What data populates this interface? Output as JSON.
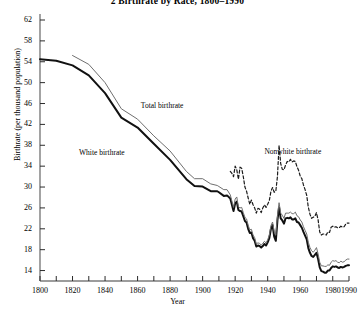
{
  "chart_data": {
    "type": "line",
    "title": "2  Birthrate by Race, 1800–1990",
    "xlabel": "Year",
    "ylabel": "Birthrate (per thousand population)",
    "xlim": [
      1800,
      1990
    ],
    "ylim": [
      12,
      62
    ],
    "grid": false,
    "legend_position": "inline-annotations",
    "xticks": [
      1800,
      1810,
      1820,
      1830,
      1840,
      1850,
      1860,
      1870,
      1880,
      1890,
      1900,
      1910,
      1920,
      1930,
      1940,
      1950,
      1960,
      1970,
      1980,
      1990
    ],
    "xtick_labels": [
      "1800",
      "1820",
      "1840",
      "1860",
      "1880",
      "1900",
      "1920",
      "1940",
      "1960",
      "1980",
      "1990"
    ],
    "xtick_label_values": [
      1800,
      1820,
      1840,
      1860,
      1880,
      1900,
      1920,
      1940,
      1960,
      1980,
      1990
    ],
    "yticks": [
      14,
      18,
      22,
      26,
      30,
      34,
      38,
      42,
      46,
      50,
      54,
      58,
      62
    ],
    "ytick_labels": [
      "14",
      "18",
      "22",
      "26",
      "30",
      "34",
      "38",
      "42",
      "46",
      "50",
      "54",
      "58",
      "62"
    ],
    "annotations": [
      {
        "text": "Total birthrate",
        "x": 1862,
        "y": 45.5
      },
      {
        "text": "White birthrate",
        "x": 1824,
        "y": 36.5
      },
      {
        "text": "Nonwhite birthrate",
        "x": 1938,
        "y": 36.8
      }
    ],
    "series": [
      {
        "name": "White birthrate",
        "style": "solid-thick",
        "color": "#111111",
        "points": [
          [
            1800,
            54.5
          ],
          [
            1810,
            54.2
          ],
          [
            1820,
            53.3
          ],
          [
            1830,
            51.4
          ],
          [
            1840,
            48.0
          ],
          [
            1850,
            43.3
          ],
          [
            1860,
            41.4
          ],
          [
            1870,
            38.3
          ],
          [
            1880,
            35.2
          ],
          [
            1890,
            31.5
          ],
          [
            1895,
            30.2
          ],
          [
            1900,
            30.1
          ],
          [
            1905,
            29.2
          ],
          [
            1909,
            29.2
          ],
          [
            1910,
            29.0
          ],
          [
            1913,
            28.3
          ],
          [
            1915,
            28.4
          ],
          [
            1917,
            27.8
          ],
          [
            1918,
            26.6
          ],
          [
            1919,
            25.4
          ],
          [
            1920,
            26.9
          ],
          [
            1921,
            27.2
          ],
          [
            1922,
            25.6
          ],
          [
            1923,
            25.4
          ],
          [
            1924,
            25.3
          ],
          [
            1925,
            24.4
          ],
          [
            1926,
            23.5
          ],
          [
            1927,
            23.2
          ],
          [
            1928,
            22.0
          ],
          [
            1929,
            21.2
          ],
          [
            1930,
            21.3
          ],
          [
            1931,
            20.2
          ],
          [
            1932,
            19.7
          ],
          [
            1933,
            18.6
          ],
          [
            1934,
            18.8
          ],
          [
            1935,
            18.7
          ],
          [
            1936,
            18.4
          ],
          [
            1937,
            18.7
          ],
          [
            1938,
            19.1
          ],
          [
            1939,
            18.8
          ],
          [
            1940,
            19.4
          ],
          [
            1941,
            20.2
          ],
          [
            1942,
            22.0
          ],
          [
            1943,
            22.7
          ],
          [
            1944,
            20.5
          ],
          [
            1945,
            19.7
          ],
          [
            1946,
            23.6
          ],
          [
            1947,
            26.1
          ],
          [
            1948,
            24.0
          ],
          [
            1949,
            23.6
          ],
          [
            1950,
            23.0
          ],
          [
            1951,
            24.0
          ],
          [
            1952,
            24.1
          ],
          [
            1953,
            24.0
          ],
          [
            1954,
            24.2
          ],
          [
            1955,
            23.8
          ],
          [
            1956,
            23.8
          ],
          [
            1957,
            24.0
          ],
          [
            1958,
            23.3
          ],
          [
            1959,
            23.2
          ],
          [
            1960,
            22.7
          ],
          [
            1961,
            22.2
          ],
          [
            1962,
            21.4
          ],
          [
            1963,
            20.7
          ],
          [
            1964,
            20.0
          ],
          [
            1965,
            18.3
          ],
          [
            1966,
            17.4
          ],
          [
            1967,
            16.8
          ],
          [
            1968,
            16.6
          ],
          [
            1969,
            17.0
          ],
          [
            1970,
            17.4
          ],
          [
            1971,
            16.2
          ],
          [
            1972,
            14.6
          ],
          [
            1973,
            13.9
          ],
          [
            1974,
            13.8
          ],
          [
            1975,
            13.6
          ],
          [
            1976,
            13.6
          ],
          [
            1977,
            14.0
          ],
          [
            1978,
            14.0
          ],
          [
            1979,
            14.5
          ],
          [
            1980,
            14.8
          ],
          [
            1981,
            14.7
          ],
          [
            1982,
            14.8
          ],
          [
            1983,
            14.6
          ],
          [
            1984,
            14.5
          ],
          [
            1985,
            14.7
          ],
          [
            1986,
            14.6
          ],
          [
            1987,
            14.7
          ],
          [
            1988,
            14.9
          ],
          [
            1989,
            15.0
          ],
          [
            1990,
            15.0
          ]
        ]
      },
      {
        "name": "Total birthrate",
        "style": "solid-thin",
        "color": "#6f6f6f",
        "points": [
          [
            1820,
            55.2
          ],
          [
            1830,
            53.5
          ],
          [
            1840,
            50.0
          ],
          [
            1850,
            45.0
          ],
          [
            1860,
            43.0
          ],
          [
            1870,
            39.8
          ],
          [
            1880,
            36.9
          ],
          [
            1890,
            33.0
          ],
          [
            1895,
            31.6
          ],
          [
            1900,
            31.6
          ],
          [
            1905,
            30.6
          ],
          [
            1909,
            30.3
          ],
          [
            1910,
            30.1
          ],
          [
            1913,
            29.5
          ],
          [
            1915,
            29.5
          ],
          [
            1917,
            28.5
          ],
          [
            1918,
            27.3
          ],
          [
            1919,
            26.1
          ],
          [
            1920,
            27.7
          ],
          [
            1921,
            28.1
          ],
          [
            1922,
            26.2
          ],
          [
            1923,
            26.0
          ],
          [
            1924,
            26.1
          ],
          [
            1925,
            25.1
          ],
          [
            1926,
            24.2
          ],
          [
            1927,
            23.9
          ],
          [
            1928,
            22.7
          ],
          [
            1929,
            21.8
          ],
          [
            1930,
            21.9
          ],
          [
            1931,
            20.8
          ],
          [
            1932,
            20.3
          ],
          [
            1933,
            19.1
          ],
          [
            1934,
            19.3
          ],
          [
            1935,
            19.2
          ],
          [
            1936,
            18.9
          ],
          [
            1937,
            19.2
          ],
          [
            1938,
            19.6
          ],
          [
            1939,
            19.3
          ],
          [
            1940,
            19.9
          ],
          [
            1941,
            20.8
          ],
          [
            1942,
            22.6
          ],
          [
            1943,
            23.3
          ],
          [
            1944,
            21.5
          ],
          [
            1945,
            20.8
          ],
          [
            1946,
            24.5
          ],
          [
            1947,
            27.0
          ],
          [
            1948,
            25.0
          ],
          [
            1949,
            24.6
          ],
          [
            1950,
            24.0
          ],
          [
            1951,
            25.0
          ],
          [
            1952,
            25.0
          ],
          [
            1953,
            25.0
          ],
          [
            1954,
            25.2
          ],
          [
            1955,
            24.9
          ],
          [
            1956,
            24.9
          ],
          [
            1957,
            25.2
          ],
          [
            1958,
            24.5
          ],
          [
            1959,
            24.3
          ],
          [
            1960,
            23.7
          ],
          [
            1961,
            23.3
          ],
          [
            1962,
            22.4
          ],
          [
            1963,
            21.7
          ],
          [
            1964,
            21.0
          ],
          [
            1965,
            19.4
          ],
          [
            1966,
            18.4
          ],
          [
            1967,
            17.8
          ],
          [
            1968,
            17.5
          ],
          [
            1969,
            17.9
          ],
          [
            1970,
            18.4
          ],
          [
            1971,
            17.2
          ],
          [
            1972,
            15.6
          ],
          [
            1973,
            14.9
          ],
          [
            1974,
            14.9
          ],
          [
            1975,
            14.8
          ],
          [
            1976,
            14.8
          ],
          [
            1977,
            15.1
          ],
          [
            1978,
            15.0
          ],
          [
            1979,
            15.6
          ],
          [
            1980,
            15.9
          ],
          [
            1981,
            15.8
          ],
          [
            1982,
            15.9
          ],
          [
            1983,
            15.6
          ],
          [
            1984,
            15.5
          ],
          [
            1985,
            15.8
          ],
          [
            1986,
            15.6
          ],
          [
            1987,
            15.7
          ],
          [
            1988,
            16.0
          ],
          [
            1989,
            16.2
          ],
          [
            1990,
            16.2
          ]
        ]
      },
      {
        "name": "Nonwhite birthrate",
        "style": "dashed",
        "color": "#1b1b1b",
        "points": [
          [
            1917,
            33.0
          ],
          [
            1918,
            32.6
          ],
          [
            1919,
            32.0
          ],
          [
            1920,
            34.0
          ],
          [
            1921,
            33.3
          ],
          [
            1922,
            31.5
          ],
          [
            1923,
            33.8
          ],
          [
            1924,
            33.6
          ],
          [
            1925,
            32.0
          ],
          [
            1926,
            30.0
          ],
          [
            1927,
            29.2
          ],
          [
            1928,
            27.9
          ],
          [
            1929,
            26.7
          ],
          [
            1930,
            27.5
          ],
          [
            1931,
            26.6
          ],
          [
            1932,
            26.0
          ],
          [
            1933,
            25.0
          ],
          [
            1934,
            25.9
          ],
          [
            1935,
            25.8
          ],
          [
            1936,
            25.1
          ],
          [
            1937,
            26.0
          ],
          [
            1938,
            26.6
          ],
          [
            1939,
            26.1
          ],
          [
            1940,
            26.7
          ],
          [
            1941,
            27.4
          ],
          [
            1942,
            29.2
          ],
          [
            1943,
            29.9
          ],
          [
            1944,
            29.0
          ],
          [
            1945,
            29.2
          ],
          [
            1946,
            32.0
          ],
          [
            1947,
            38.0
          ],
          [
            1948,
            34.5
          ],
          [
            1949,
            33.4
          ],
          [
            1950,
            33.3
          ],
          [
            1951,
            34.2
          ],
          [
            1952,
            34.9
          ],
          [
            1953,
            34.8
          ],
          [
            1954,
            35.3
          ],
          [
            1955,
            34.8
          ],
          [
            1956,
            35.0
          ],
          [
            1957,
            34.9
          ],
          [
            1958,
            33.9
          ],
          [
            1959,
            33.2
          ],
          [
            1960,
            32.1
          ],
          [
            1961,
            31.6
          ],
          [
            1962,
            30.4
          ],
          [
            1963,
            29.5
          ],
          [
            1964,
            28.4
          ],
          [
            1965,
            26.1
          ],
          [
            1966,
            24.8
          ],
          [
            1967,
            24.0
          ],
          [
            1968,
            24.2
          ],
          [
            1969,
            24.4
          ],
          [
            1970,
            25.1
          ],
          [
            1971,
            23.7
          ],
          [
            1972,
            21.4
          ],
          [
            1973,
            20.8
          ],
          [
            1974,
            21.0
          ],
          [
            1975,
            21.0
          ],
          [
            1976,
            20.8
          ],
          [
            1977,
            21.4
          ],
          [
            1978,
            21.3
          ],
          [
            1979,
            22.3
          ],
          [
            1980,
            22.5
          ],
          [
            1981,
            22.3
          ],
          [
            1982,
            22.4
          ],
          [
            1983,
            22.2
          ],
          [
            1984,
            22.2
          ],
          [
            1985,
            22.5
          ],
          [
            1986,
            22.3
          ],
          [
            1987,
            22.4
          ],
          [
            1988,
            22.9
          ],
          [
            1989,
            23.1
          ],
          [
            1990,
            23.1
          ]
        ]
      }
    ]
  }
}
